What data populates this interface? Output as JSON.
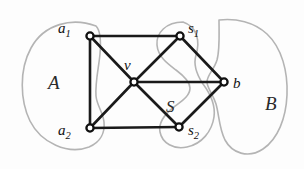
{
  "figure": {
    "type": "graph-diagram",
    "width": 304,
    "height": 169,
    "background_color": "#fdfdfd",
    "edge_color": "#1a1a1a",
    "node_fill_color": "#ffffff",
    "node_stroke_color": "#101010",
    "blob_stroke_color": "#b4b4b4"
  },
  "vertices": [
    {
      "id": "a1",
      "label": "a",
      "subscript": "1",
      "x": 90,
      "y": 36,
      "label_x": 58,
      "label_y": 33
    },
    {
      "id": "a2",
      "label": "a",
      "subscript": "2",
      "x": 90,
      "y": 128,
      "label_x": 58,
      "label_y": 135
    },
    {
      "id": "v",
      "label": "v",
      "subscript": "",
      "x": 134,
      "y": 82,
      "label_x": 124,
      "label_y": 70
    },
    {
      "id": "s1",
      "label": "s",
      "subscript": "1",
      "x": 180,
      "y": 36,
      "label_x": 188,
      "label_y": 33
    },
    {
      "id": "s2",
      "label": "s",
      "subscript": "2",
      "x": 179,
      "y": 127,
      "label_x": 188,
      "label_y": 135
    },
    {
      "id": "b",
      "label": "b",
      "subscript": "",
      "x": 224,
      "y": 82,
      "label_x": 233,
      "label_y": 88
    }
  ],
  "edges": [
    {
      "from": "a1",
      "to": "s1"
    },
    {
      "from": "a1",
      "to": "a2"
    },
    {
      "from": "a1",
      "to": "v"
    },
    {
      "from": "a2",
      "to": "s2"
    },
    {
      "from": "a2",
      "to": "v"
    },
    {
      "from": "v",
      "to": "s1"
    },
    {
      "from": "v",
      "to": "s2"
    },
    {
      "from": "v",
      "to": "b"
    },
    {
      "from": "s1",
      "to": "b"
    },
    {
      "from": "s2",
      "to": "b"
    }
  ],
  "regions": [
    {
      "id": "A",
      "label": "A",
      "label_x": 48,
      "label_y": 89,
      "path": "M 96 26 C 72 17 44 24 31 48 C 19 70 20 100 30 121 C 41 143 68 155 89 147 C 101 142 105 132 104 122 C 103 112 97 106 96 96 C 95 82 99 66 100 54 C 101 42 101 31 96 26 Z"
    },
    {
      "id": "S",
      "label": "S",
      "label_x": 166,
      "label_y": 112,
      "path": "M 183 22 C 166 22 156 33 157 45 C 158 57 168 64 176 70 C 184 76 190 82 190 88 C 190 96 182 101 174 107 C 165 114 158 122 160 132 C 162 143 174 150 187 147 C 202 144 212 131 214 117 C 216 103 209 92 203 84 C 197 75 193 65 196 55 C 200 42 198 27 183 22 Z"
    },
    {
      "id": "B",
      "label": "B",
      "label_x": 265,
      "label_y": 110,
      "path": "M 219 20 C 236 18 254 22 267 34 C 282 48 288 72 287 95 C 286 118 278 139 263 149 C 248 159 232 153 225 140 C 219 128 219 114 216 104 C 213 94 207 88 207 82 C 207 75 214 70 217 60 C 220 49 219 33 219 20 Z"
    }
  ]
}
